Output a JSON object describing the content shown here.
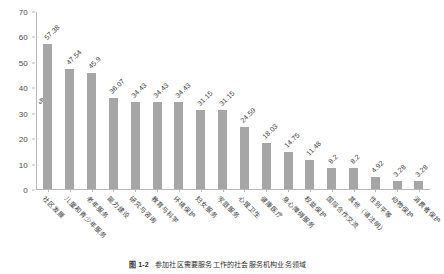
{
  "chart_data": {
    "type": "bar",
    "title": "",
    "xlabel": "",
    "ylabel": "%",
    "ylim": [
      0,
      70
    ],
    "ytick_step": 10,
    "yticks": [
      "70",
      "60",
      "50",
      "40",
      "30",
      "20",
      "10",
      "0"
    ],
    "grid": false,
    "legend": false,
    "bar_color": "#a6a6a6",
    "orientation": "vertical",
    "value_label_rotation": -45,
    "category_label_rotation": 45,
    "categories": [
      "社区发展",
      "儿童和青少年服务",
      "老年服务",
      "能力建设",
      "研究与咨询",
      "教育与科学",
      "环境保护",
      "妇女服务",
      "家庭服务",
      "心理卫生",
      "健康医疗",
      "身心障碍服务",
      "权益保护",
      "国际合作交流",
      "其他（请注明）",
      "性别平等",
      "动物保护",
      "消费者保护"
    ],
    "values": [
      57.38,
      47.54,
      45.9,
      36.07,
      34.43,
      34.43,
      34.43,
      31.15,
      31.15,
      24.59,
      18.03,
      14.75,
      11.48,
      8.2,
      8.2,
      4.92,
      3.28,
      3.28
    ],
    "value_labels": [
      "57.38",
      "47.54",
      "45.9",
      "36.07",
      "34.43",
      "34.43",
      "34.43",
      "31.15",
      "31.15",
      "24.59",
      "18.03",
      "14.75",
      "11.48",
      "8.2",
      "8.2",
      "4.92",
      "3.28",
      "3.28"
    ]
  },
  "caption": {
    "label": "图 1-2",
    "text": "参加社区需要服务工作的社会服务机构业务领域"
  }
}
